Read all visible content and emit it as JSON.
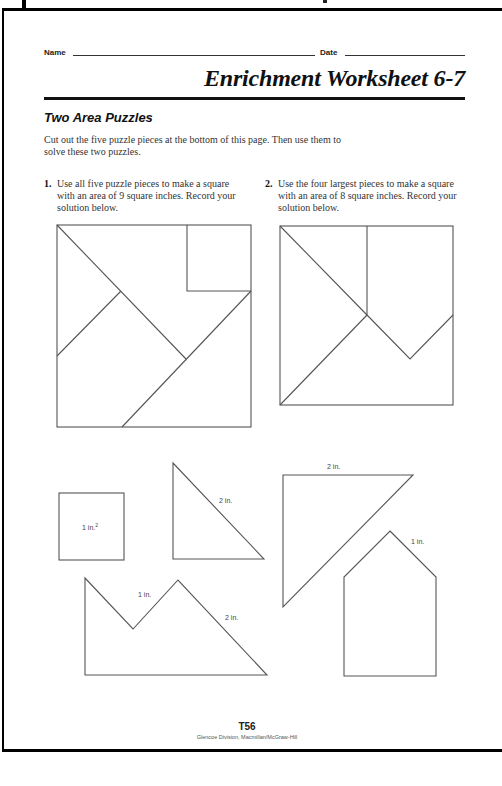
{
  "header": {
    "name_label": "Name",
    "date_label": "Date",
    "title": "Enrichment Worksheet 6-7"
  },
  "section": {
    "subtitle": "Two Area Puzzles",
    "intro": "Cut out the five puzzle pieces at the bottom of this page. Then use them to solve these two puzzles."
  },
  "problems": [
    {
      "number": "1.",
      "text": "Use all five puzzle pieces to make a square with an area of 9 square inches. Record your solution below."
    },
    {
      "number": "2.",
      "text": "Use the four largest pieces to make a square with an area of 8 square inches. Record your solution below."
    }
  ],
  "pieces": {
    "square_label": "1 in.",
    "square_label_sup": "2",
    "small_triangle_label": "2 in.",
    "large_triangle_label": "2 in.",
    "house_label": "1 in.",
    "pentagon_label_short": "1 in.",
    "pentagon_label_long": "2 in."
  },
  "footer": {
    "page_number": "T56",
    "publisher": "Glencoe Division, Macmillan/McGraw-Hill"
  }
}
